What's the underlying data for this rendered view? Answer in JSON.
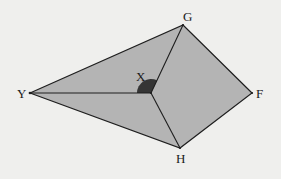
{
  "diagram": {
    "type": "geometry-figure",
    "fill_color": "#b4b4b4",
    "stroke_color": "#1e1e1e",
    "angle_mark_color": "#1e1e1e",
    "vertices": [
      {
        "name": "G",
        "label": "G",
        "x": 183,
        "y": 25
      },
      {
        "name": "Y",
        "label": "Y",
        "x": 30,
        "y": 93
      },
      {
        "name": "X",
        "label": "X",
        "x": 151,
        "y": 93
      },
      {
        "name": "F",
        "label": "F",
        "x": 252,
        "y": 93
      },
      {
        "name": "H",
        "label": "H",
        "x": 180,
        "y": 148
      }
    ],
    "outer_polygon": [
      "Y",
      "G",
      "F",
      "H"
    ],
    "segments": [
      [
        "Y",
        "G"
      ],
      [
        "G",
        "F"
      ],
      [
        "F",
        "H"
      ],
      [
        "H",
        "Y"
      ],
      [
        "Y",
        "X"
      ],
      [
        "X",
        "G"
      ],
      [
        "X",
        "H"
      ]
    ],
    "marked_angle": {
      "vertex": "X",
      "from": "Y",
      "to": "G",
      "style": "filled-arc"
    }
  }
}
